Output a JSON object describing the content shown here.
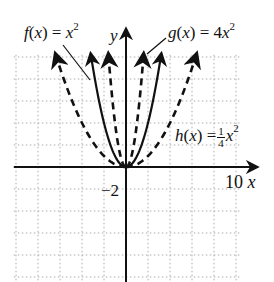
{
  "chart_data": {
    "type": "line",
    "title": "",
    "xlabel": "x",
    "ylabel": "y",
    "grid": true,
    "grid_step": 2,
    "xlim": [
      -10,
      12
    ],
    "ylim": [
      -10,
      10.5
    ],
    "tick_labels": {
      "x": [
        {
          "value": 10,
          "label": "10"
        }
      ],
      "y": [
        {
          "value": -2,
          "label": "-2"
        }
      ]
    },
    "series": [
      {
        "name": "f(x) = x^2",
        "label_text": "f(x) = x",
        "exponent": "2",
        "expression": "x^2",
        "coef": 1,
        "style": "solid",
        "x": [
          -3.2,
          -2,
          -1,
          0,
          1,
          2,
          3.2
        ],
        "values": [
          10.24,
          4,
          1,
          0,
          1,
          4,
          10.24
        ]
      },
      {
        "name": "g(x) = 4x^2",
        "label_text": "g(x) = 4x",
        "exponent": "2",
        "expression": "4x^2",
        "coef": 4,
        "style": "dashed",
        "x": [
          -1.6,
          -1,
          -0.5,
          0,
          0.5,
          1,
          1.6
        ],
        "values": [
          10.24,
          4,
          1,
          0,
          1,
          4,
          10.24
        ]
      },
      {
        "name": "h(x) = (1/4)x^2",
        "label_text": "h(x) =",
        "frac_num": "1",
        "frac_den": "4",
        "exponent": "2",
        "expression": "(1/4)x^2",
        "coef": 0.25,
        "style": "dashed",
        "x": [
          -6.4,
          -4,
          -2,
          0,
          2,
          4,
          6.4
        ],
        "values": [
          10.24,
          4,
          1,
          0,
          1,
          4,
          10.24
        ]
      }
    ]
  },
  "labels": {
    "x_axis": "x",
    "y_axis": "y",
    "x_tick": "10",
    "y_tick": "−2",
    "f_prefix": "f",
    "f_mid": "(x) = x",
    "g_prefix": "g",
    "g_mid": "(x) = 4x",
    "h_prefix": "h",
    "h_mid": "(x) =",
    "exp": "2",
    "frac_num": "1",
    "frac_den": "4"
  }
}
